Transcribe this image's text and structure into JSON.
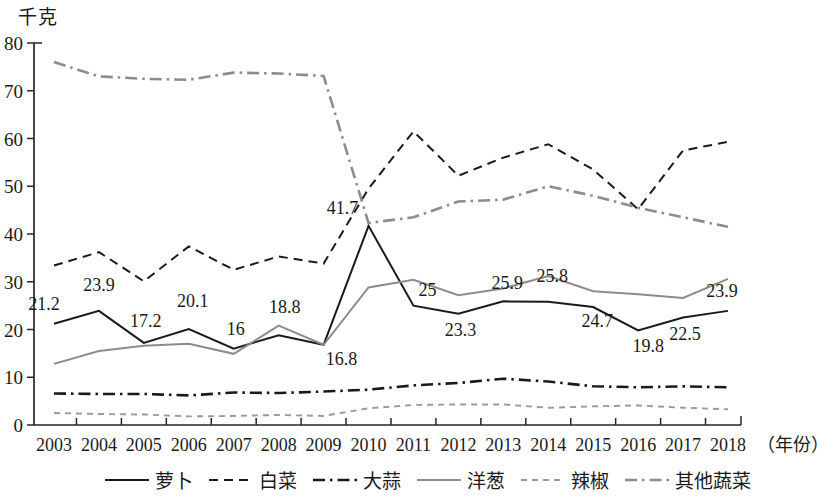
{
  "axis": {
    "y_unit_label": "千克",
    "x_axis_name": "（年份）",
    "y_ticks": [
      "0",
      "10",
      "20",
      "30",
      "40",
      "50",
      "60",
      "70",
      "80"
    ],
    "y_min": 0,
    "y_max": 80,
    "y_step": 10
  },
  "legend": {
    "items": [
      {
        "label": "萝卜",
        "style": "solid",
        "color": "#1a1a1a"
      },
      {
        "label": "白菜",
        "style": "dashed",
        "color": "#1a1a1a"
      },
      {
        "label": "大蒜",
        "style": "dashdot",
        "color": "#1a1a1a"
      },
      {
        "label": "洋葱",
        "style": "solid",
        "color": "#8c8c8c"
      },
      {
        "label": "辣椒",
        "style": "dotted",
        "color": "#9a9a9a"
      },
      {
        "label": "其他蔬菜",
        "style": "dashdot",
        "color": "#8c8c8c"
      }
    ]
  },
  "chart_data": {
    "type": "line",
    "title": "",
    "subtitle": "",
    "xlabel": "（年份）",
    "ylabel": "千克",
    "ylim": [
      0,
      80
    ],
    "ytick_step": 10,
    "grid": false,
    "legend_position": "bottom",
    "categories": [
      "2003",
      "2004",
      "2005",
      "2006",
      "2007",
      "2008",
      "2009",
      "2010",
      "2011",
      "2012",
      "2013",
      "2014",
      "2015",
      "2016",
      "2017",
      "2018"
    ],
    "series": [
      {
        "name": "萝卜",
        "color": "#1a1a1a",
        "style": "solid",
        "values": [
          21.2,
          23.9,
          17.2,
          20.1,
          16,
          18.8,
          16.8,
          41.7,
          25,
          23.3,
          25.9,
          25.8,
          24.7,
          19.8,
          22.5,
          23.9
        ],
        "data_labels": [
          "21.2",
          "23.9",
          "17.2",
          "20.1",
          "16",
          "18.8",
          "16.8",
          "41.7",
          "25",
          "23.3",
          "25.9",
          "25.8",
          "24.7",
          "19.8",
          "22.5",
          "23.9"
        ]
      },
      {
        "name": "白菜",
        "color": "#1a1a1a",
        "style": "dashed",
        "values": [
          33.4,
          36.2,
          30.1,
          37.4,
          32.5,
          35.3,
          33.8,
          49.5,
          61.5,
          52.2,
          56.0,
          58.8,
          53.5,
          45.2,
          57.5,
          59.3
        ]
      },
      {
        "name": "大蒜",
        "color": "#1a1a1a",
        "style": "dashdot",
        "values": [
          6.6,
          6.5,
          6.5,
          6.2,
          6.8,
          6.7,
          7.0,
          7.4,
          8.3,
          8.8,
          9.7,
          9.1,
          8.1,
          7.9,
          8.1,
          7.9
        ]
      },
      {
        "name": "洋葱",
        "color": "#8c8c8c",
        "style": "solid",
        "values": [
          12.8,
          15.5,
          16.6,
          17.0,
          14.9,
          20.8,
          16.8,
          28.8,
          30.4,
          27.2,
          28.6,
          31.2,
          28.0,
          27.4,
          26.6,
          30.6
        ]
      },
      {
        "name": "辣椒",
        "color": "#9a9a9a",
        "style": "dotted",
        "values": [
          2.5,
          2.3,
          2.2,
          1.8,
          1.9,
          2.1,
          1.9,
          3.5,
          4.2,
          4.3,
          4.3,
          3.6,
          3.9,
          4.1,
          3.6,
          3.3
        ]
      },
      {
        "name": "其他蔬菜",
        "color": "#8c8c8c",
        "style": "dashdot",
        "values": [
          76.0,
          73.0,
          72.5,
          72.3,
          73.8,
          73.6,
          73.1,
          42.3,
          43.5,
          46.8,
          47.2,
          50.0,
          48.0,
          45.5,
          43.5,
          41.5
        ]
      }
    ]
  }
}
